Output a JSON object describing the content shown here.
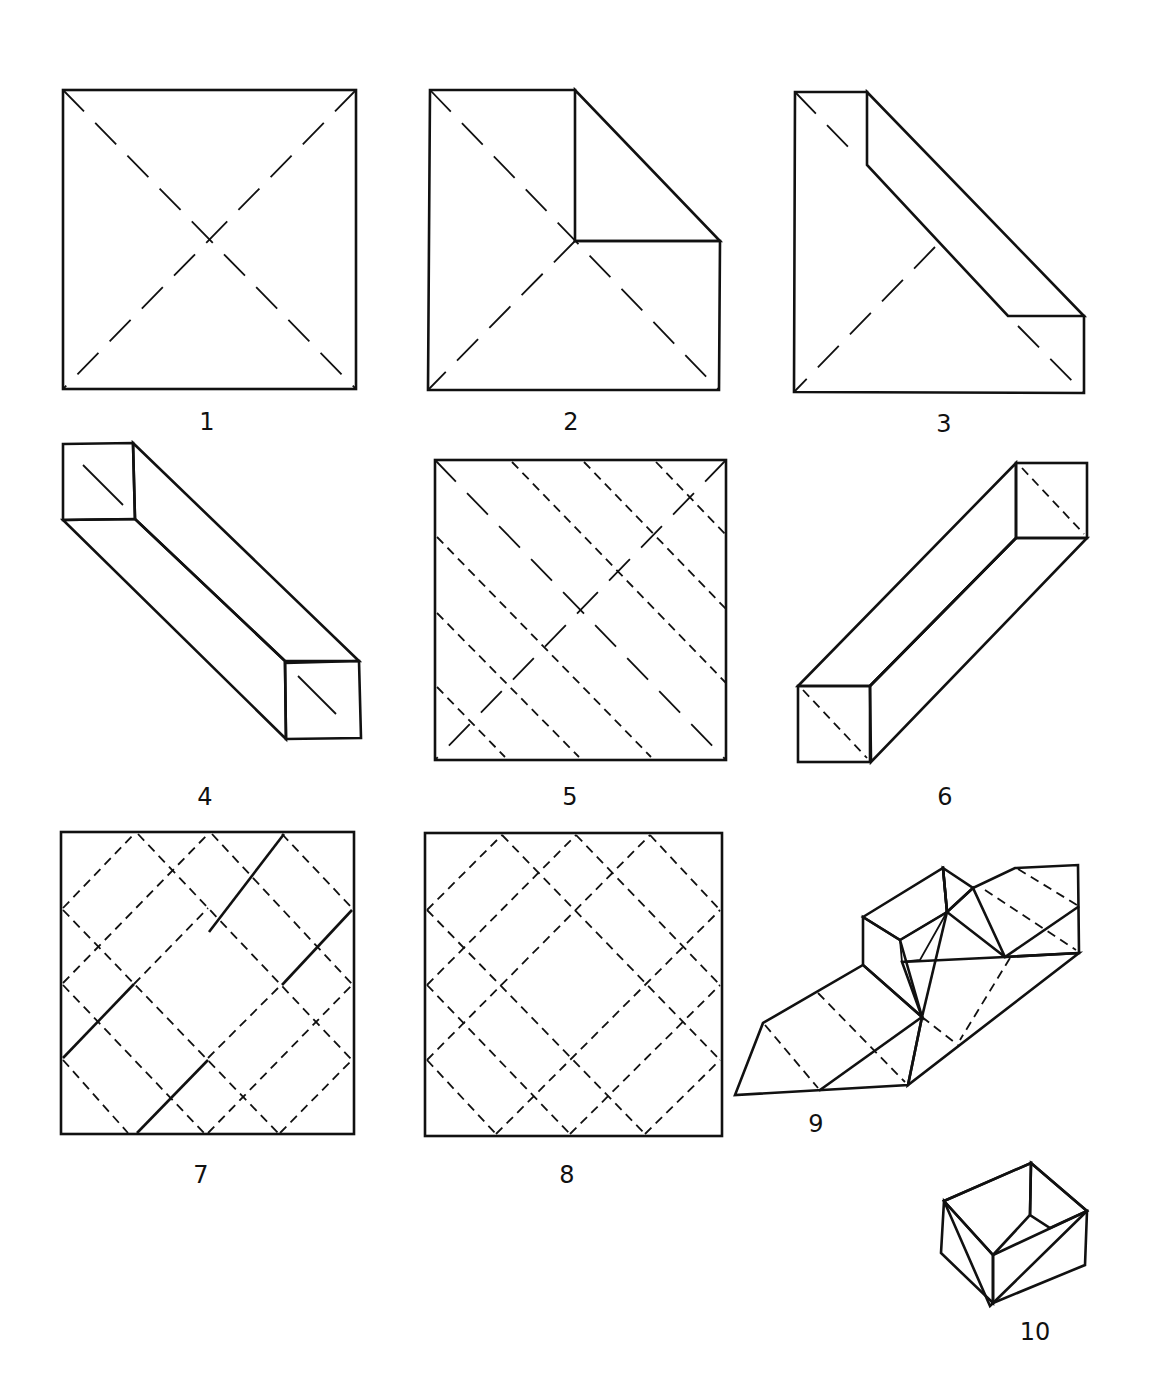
{
  "steps": [
    {
      "number": "1",
      "label": "1",
      "description": "Square sheet with both diagonal valley creases"
    },
    {
      "number": "2",
      "label": "2",
      "description": "Top-right corner folded to center"
    },
    {
      "number": "3",
      "label": "3",
      "description": "Upper-right edge folded to the diagonal"
    },
    {
      "number": "4",
      "label": "4",
      "description": "Both sides folded to form a long diagonal strip"
    },
    {
      "number": "5",
      "label": "5",
      "description": "Unfolded sheet showing diagonal crease pattern"
    },
    {
      "number": "6",
      "label": "6",
      "description": "Strip folded along the other diagonal"
    },
    {
      "number": "7",
      "label": "7",
      "description": "Crease pattern with mountain folds marked solid"
    },
    {
      "number": "8",
      "label": "8",
      "description": "Full lattice crease pattern"
    },
    {
      "number": "9",
      "label": "9",
      "description": "Collapsing the sides into the box"
    },
    {
      "number": "10",
      "label": "10",
      "description": "Finished box"
    }
  ],
  "legend": {
    "solid_thin": "fold line",
    "dashed": "valley fold",
    "hatched": "reverse side of paper"
  },
  "colors": {
    "ink": "#111111",
    "paper": "#ffffff"
  }
}
